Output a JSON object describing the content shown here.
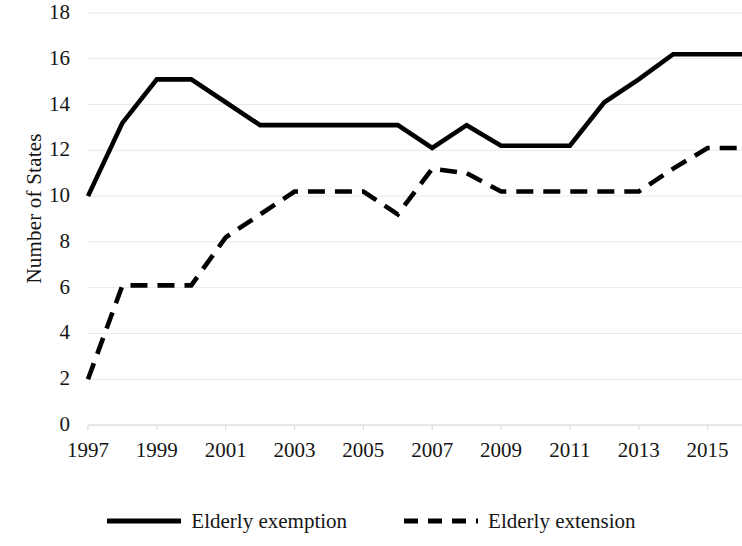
{
  "chart_data": {
    "type": "line",
    "title": "",
    "xlabel": "",
    "ylabel": "Number of States",
    "xlim": [
      1997,
      2016
    ],
    "ylim": [
      0,
      18
    ],
    "ytick_labels": [
      "18",
      "16",
      "14",
      "12",
      "10",
      "8",
      "6",
      "4",
      "2",
      "0"
    ],
    "ytick_values": [
      18,
      16,
      14,
      12,
      10,
      8,
      6,
      4,
      2,
      0
    ],
    "xtick_labels": [
      "1997",
      "1999",
      "2001",
      "2003",
      "2005",
      "2007",
      "2009",
      "2011",
      "2013",
      "2015"
    ],
    "xtick_values": [
      1997,
      1999,
      2001,
      2003,
      2005,
      2007,
      2009,
      2011,
      2013,
      2015
    ],
    "grid": true,
    "legend_position": "bottom",
    "x": [
      1997,
      1998,
      1999,
      2000,
      2001,
      2002,
      2003,
      2004,
      2005,
      2006,
      2007,
      2008,
      2009,
      2010,
      2011,
      2012,
      2013,
      2014,
      2015,
      2016
    ],
    "series": [
      {
        "name": "Elderly exemption",
        "style": "solid",
        "color": "#000000",
        "values": [
          10.0,
          13.2,
          15.1,
          15.1,
          14.1,
          13.1,
          13.1,
          13.1,
          13.1,
          13.1,
          12.1,
          13.1,
          12.2,
          12.2,
          12.2,
          14.1,
          15.1,
          16.2,
          16.2,
          16.2
        ]
      },
      {
        "name": "Elderly extension",
        "style": "dashed",
        "color": "#000000",
        "values": [
          2.0,
          6.1,
          6.1,
          6.1,
          8.2,
          9.2,
          10.2,
          10.2,
          10.2,
          9.2,
          11.2,
          11.0,
          10.2,
          10.2,
          10.2,
          10.2,
          10.2,
          11.2,
          12.1,
          12.1
        ]
      }
    ]
  },
  "axis": {
    "y_title": "Number of States"
  },
  "legend": {
    "items": [
      {
        "label": "Elderly exemption",
        "style": "solid"
      },
      {
        "label": "Elderly extension",
        "style": "dashed"
      }
    ]
  }
}
